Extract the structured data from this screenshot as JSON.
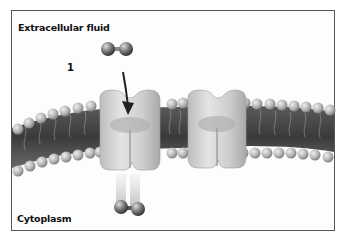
{
  "figure": {
    "labels": {
      "extracellular": "Extracellular fluid",
      "cytoplasm": "Cytoplasm",
      "step": "1"
    },
    "elements": {
      "membrane": "phospholipid-bilayer",
      "proteins": [
        "channel-protein-left",
        "channel-protein-right"
      ],
      "molecule_top": "diatomic-molecule",
      "molecule_bottom": "diatomic-molecule",
      "arrow": "down-arrow"
    },
    "colors": {
      "frame": "#555555",
      "membrane_dark": "#4a4a4a",
      "head": "#b8b8b8",
      "protein": "#cfcfcf",
      "molecule": "#6a6a6a"
    }
  }
}
